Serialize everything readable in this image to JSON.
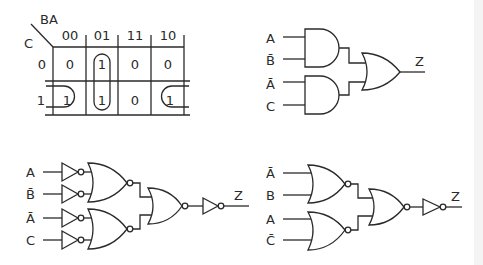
{
  "kmap": {
    "row_var": "C",
    "col_vars": "BA",
    "col_headers": [
      "00",
      "01",
      "11",
      "10"
    ],
    "row_headers": [
      "0",
      "1"
    ],
    "cells": [
      [
        "0",
        "1",
        "0",
        "0"
      ],
      [
        "1",
        "1",
        "0",
        "1"
      ]
    ],
    "groups": [
      "column 01 (C=0,1)",
      "row 1 cells 00 and 10 (wrap-around)"
    ]
  },
  "circuit_and_or": {
    "inputs": [
      "A",
      "B̄",
      "Ā",
      "C"
    ],
    "output": "Z",
    "gates": [
      "AND",
      "AND",
      "OR"
    ]
  },
  "circuit_nor_with_inverters": {
    "inputs": [
      "A",
      "B̄",
      "Ā",
      "C"
    ],
    "output": "Z",
    "gates": [
      "NOT",
      "NOT",
      "NOT",
      "NOT",
      "NOR",
      "NOR",
      "NOR",
      "NOT"
    ]
  },
  "circuit_nor": {
    "inputs": [
      "Ā",
      "B",
      "A",
      "C̄"
    ],
    "output": "Z",
    "gates": [
      "NOR",
      "NOR",
      "NOR",
      "NOT"
    ]
  }
}
